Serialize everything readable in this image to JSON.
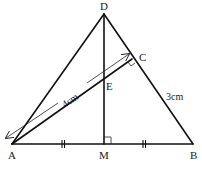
{
  "diagram": {
    "colors": {
      "stroke": "#111111",
      "background": "#ffffff"
    },
    "points": {
      "A": {
        "label": "A",
        "x": 12,
        "y": 144
      },
      "B": {
        "label": "B",
        "x": 193,
        "y": 144
      },
      "D": {
        "label": "D",
        "x": 104,
        "y": 14
      },
      "M": {
        "label": "M",
        "x": 104,
        "y": 144
      },
      "C": {
        "label": "C",
        "x": 132,
        "y": 59
      },
      "E": {
        "label": "E",
        "x": 104,
        "y": 77
      }
    },
    "segments": [
      "AB",
      "AD",
      "DB",
      "DM",
      "AC"
    ],
    "right_angles": [
      "DMA at M",
      "ACB at C"
    ],
    "equal_marks": [
      "AM",
      "MB"
    ],
    "measurements": {
      "AC": "4cm",
      "CB": "3cm"
    }
  }
}
